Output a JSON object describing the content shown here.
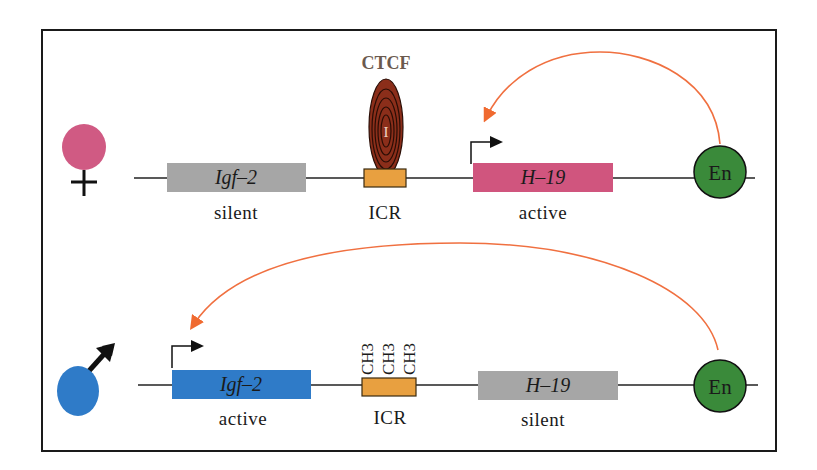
{
  "colors": {
    "frame": "#1a1a1a",
    "female": "#d05a83",
    "male": "#2f7bc8",
    "silent_gene": "#a6a6a6",
    "h19_active": "#d0557e",
    "igf2_active": "#2f7bc8",
    "icr": "#e8a040",
    "ctcf": "#8b2e1a",
    "ctcf_label": "#6b5a4e",
    "enhancer": "#3a8a3a",
    "arc": "#f07040"
  },
  "maternal": {
    "symbol": "female-symbol",
    "genes": [
      {
        "name": "Igf-2",
        "state": "silent"
      },
      {
        "name": "ICR",
        "state": ""
      },
      {
        "name": "H-19",
        "state": "active"
      }
    ],
    "igf2_label": "Igf–2",
    "igf2_state": "silent",
    "icr_label": "ICR",
    "ctcf_label": "CTCF",
    "ctcf_inner": "I",
    "h19_label": "H–19",
    "h19_state": "active",
    "enhancer_label": "En"
  },
  "paternal": {
    "symbol": "male-symbol",
    "igf2_label": "Igf–2",
    "igf2_state": "active",
    "icr_label": "ICR",
    "methyl_marks": [
      "CH3",
      "CH3",
      "CH3"
    ],
    "h19_label": "H–19",
    "h19_state": "silent",
    "enhancer_label": "En"
  }
}
